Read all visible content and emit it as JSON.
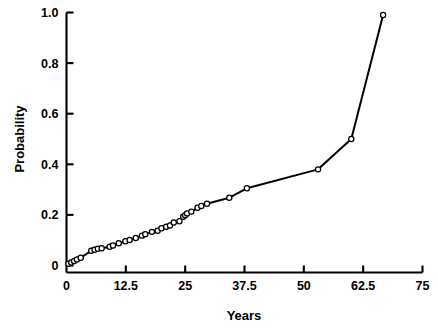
{
  "chart_data": {
    "type": "line",
    "title": "",
    "subtitle": "",
    "xlabel": "Years",
    "ylabel": "Probability",
    "xlim": [
      0,
      75
    ],
    "ylim": [
      0,
      1.0
    ],
    "grid": false,
    "legend": null,
    "marker": "open-circle",
    "line_color": "#000000",
    "marker_face_color": "#ffffff",
    "marker_edge_color": "#000000",
    "xticks": [
      0,
      12.5,
      25,
      37.5,
      50,
      62.5,
      75
    ],
    "xtick_labels": [
      "0",
      "12.5",
      "25",
      "37.5",
      "50",
      "62.5",
      "75"
    ],
    "yticks": [
      0,
      0.2,
      0.4,
      0.6,
      0.8,
      1.0
    ],
    "ytick_labels": [
      "0",
      "0.2",
      "0.4",
      "0.6",
      "0.8",
      "1.0"
    ],
    "series": [
      {
        "name": "Cumulative probability",
        "x": [
          0.4,
          1.0,
          1.6,
          2.2,
          3.0,
          5.2,
          5.9,
          6.6,
          7.4,
          9.1,
          9.8,
          11.0,
          12.4,
          13.3,
          14.6,
          15.9,
          16.6,
          18.0,
          19.2,
          20.0,
          21.0,
          21.8,
          22.6,
          23.8,
          24.6,
          25.0,
          25.4,
          26.3,
          27.6,
          28.4,
          29.6,
          34.3,
          38.0,
          53.0,
          60.0,
          66.7
        ],
        "y": [
          0.007,
          0.012,
          0.018,
          0.024,
          0.031,
          0.058,
          0.062,
          0.066,
          0.068,
          0.074,
          0.079,
          0.088,
          0.096,
          0.101,
          0.109,
          0.118,
          0.124,
          0.133,
          0.137,
          0.147,
          0.153,
          0.158,
          0.17,
          0.175,
          0.193,
          0.199,
          0.206,
          0.213,
          0.228,
          0.235,
          0.244,
          0.268,
          0.305,
          0.38,
          0.5,
          0.99
        ]
      }
    ]
  },
  "axes": {
    "x_axis_name": "years-axis",
    "y_axis_name": "probability-axis"
  }
}
